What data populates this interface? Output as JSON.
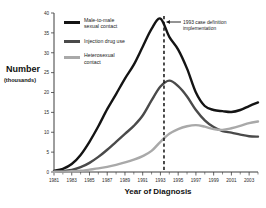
{
  "chart_data": {
    "type": "line",
    "title": "",
    "xlabel": "Year of Diagnosis",
    "ylabel": "Number",
    "ylabel_sub": "(thousands)",
    "xlim": [
      1981,
      2004
    ],
    "ylim": [
      0,
      40
    ],
    "yticks": [
      0,
      5,
      10,
      15,
      20,
      25,
      30,
      35,
      40
    ],
    "ytick_labels": [
      "0",
      "5",
      "10",
      "15",
      "20",
      "25",
      "30",
      "35",
      "40"
    ],
    "xticks": [
      1981,
      1983,
      1985,
      1987,
      1989,
      1991,
      1993,
      1995,
      1997,
      1999,
      2001,
      2003
    ],
    "xtick_labels": [
      "1981",
      "1983",
      "1985",
      "1987",
      "1989",
      "1991",
      "1993",
      "1995",
      "1997",
      "1999",
      "2001",
      "2003"
    ],
    "xticks_minor": [
      1982,
      1984,
      1986,
      1988,
      1990,
      1992,
      1994,
      1996,
      1998,
      2000,
      2002,
      2004
    ],
    "grid": false,
    "legend_position": "upper-left-inside",
    "x": [
      1981,
      1982,
      1983,
      1984,
      1985,
      1986,
      1987,
      1988,
      1989,
      1990,
      1991,
      1992,
      1993,
      1994,
      1995,
      1996,
      1997,
      1998,
      1999,
      2000,
      2001,
      2002,
      2003,
      2004
    ],
    "series": [
      {
        "name": "Male-to-male sexual contact",
        "color": "#141414",
        "width": 2.4,
        "values": [
          0.3,
          0.8,
          2.0,
          4.3,
          7.6,
          11.5,
          15.8,
          19.6,
          23.5,
          27.0,
          31.5,
          36.0,
          38.6,
          34.0,
          30.8,
          26.0,
          20.0,
          16.6,
          15.6,
          15.3,
          15.1,
          15.6,
          16.6,
          17.5
        ]
      },
      {
        "name": "Injection drug use",
        "color": "#4a4a4a",
        "width": 2.4,
        "values": [
          0.1,
          0.2,
          0.5,
          1.2,
          2.3,
          3.8,
          5.6,
          7.6,
          9.6,
          11.6,
          14.2,
          18.0,
          21.5,
          23.0,
          21.6,
          19.0,
          15.6,
          13.0,
          11.3,
          10.3,
          9.9,
          9.4,
          9.0,
          8.9
        ]
      },
      {
        "name": "Heterosexual contact",
        "color": "#a9a9a9",
        "width": 2.4,
        "values": [
          0.05,
          0.1,
          0.2,
          0.3,
          0.6,
          0.9,
          1.3,
          1.8,
          2.4,
          3.1,
          4.0,
          5.3,
          7.6,
          9.6,
          10.8,
          11.5,
          11.8,
          11.4,
          10.8,
          10.6,
          11.0,
          11.6,
          12.3,
          12.7
        ]
      }
    ],
    "annotations": [
      {
        "name": "event-marker",
        "type": "vline",
        "x": 1993.4,
        "label_line1": "1993 case definition",
        "label_line2": "implementation",
        "style": "dashed"
      }
    ]
  },
  "legend": {
    "items": [
      {
        "label_line1": "Male-to-male",
        "label_line2": "sexual contact"
      },
      {
        "label_line1": "Injection drug use",
        "label_line2": ""
      },
      {
        "label_line1": "Heterosexual",
        "label_line2": "contact"
      }
    ]
  },
  "caption": {
    "text": ""
  }
}
